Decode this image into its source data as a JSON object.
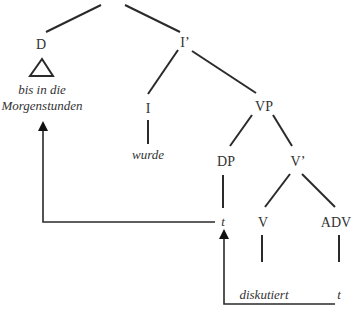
{
  "diagram": {
    "type": "syntax-tree",
    "nodes": {
      "D": "D",
      "I_bar": "I’",
      "I": "I",
      "VP": "VP",
      "DP": "DP",
      "V_bar": "V’",
      "V": "V",
      "ADV": "ADV"
    },
    "leaves": {
      "d_line1": "bis in die",
      "d_line2": "Morgenstunden",
      "i_word": "wurde",
      "dp_trace": "t",
      "v_word": "diskutiert",
      "adv_trace": "t"
    },
    "movement_arrows": [
      {
        "from": "DP trace t",
        "to": "D (bis in die Morgenstunden)"
      },
      {
        "from": "ADV trace t",
        "to": "DP trace t"
      }
    ],
    "line_color": "#333333"
  }
}
